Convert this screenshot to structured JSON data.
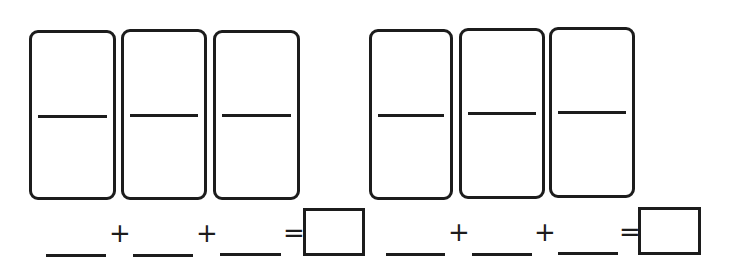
{
  "worksheet": {
    "groups": [
      {
        "dominoes": [
          {
            "id": 1
          },
          {
            "id": 2
          },
          {
            "id": 3
          }
        ],
        "equation": {
          "blanks": [
            "",
            "",
            ""
          ],
          "operators": [
            "+",
            "+"
          ],
          "equals": "=",
          "answer": ""
        }
      },
      {
        "dominoes": [
          {
            "id": 4
          },
          {
            "id": 5
          },
          {
            "id": 6
          }
        ],
        "equation": {
          "blanks": [
            "",
            "",
            ""
          ],
          "operators": [
            "+",
            "+"
          ],
          "equals": "=",
          "answer": ""
        }
      }
    ],
    "colors": {
      "ink": "#1c1c1c",
      "background": "#ffffff"
    }
  }
}
